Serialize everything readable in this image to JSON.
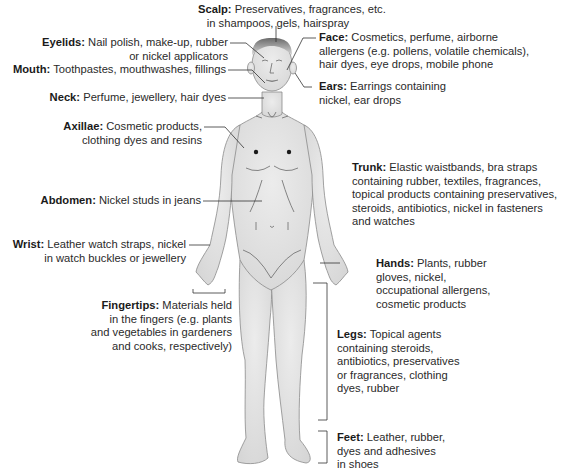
{
  "figure": {
    "body_fill": "#e4e4e4",
    "body_outline": "#8a8a8a",
    "line_color": "#333333"
  },
  "labels": {
    "scalp": {
      "title": "Scalp:",
      "lines": [
        "Preservatives, fragrances, etc.",
        "in shampoos, gels, hairspray"
      ]
    },
    "eyelids": {
      "title": "Eyelids:",
      "lines": [
        "Nail polish, make-up, rubber",
        "or nickel applicators"
      ]
    },
    "mouth": {
      "title": "Mouth:",
      "lines": [
        "Toothpastes, mouthwashes, fillings"
      ]
    },
    "neck": {
      "title": "Neck:",
      "lines": [
        "Perfume, jewellery, hair dyes"
      ]
    },
    "axillae": {
      "title": "Axillae:",
      "lines": [
        "Cosmetic products,",
        "clothing dyes and resins"
      ]
    },
    "abdomen": {
      "title": "Abdomen:",
      "lines": [
        "Nickel studs in jeans"
      ]
    },
    "wrist": {
      "title": "Wrist:",
      "lines": [
        "Leather watch straps, nickel",
        "in watch buckles or jewellery"
      ]
    },
    "fingertips": {
      "title": "Fingertips:",
      "lines": [
        "Materials held",
        "in the fingers (e.g. plants",
        "and vegetables in gardeners",
        "and cooks, respectively)"
      ]
    },
    "face": {
      "title": "Face:",
      "lines": [
        "Cosmetics, perfume, airborne",
        "allergens (e.g. pollens, volatile chemicals),",
        "hair dyes, eye drops, mobile phone"
      ]
    },
    "ears": {
      "title": "Ears:",
      "lines": [
        "Earrings containing",
        "nickel, ear drops"
      ]
    },
    "trunk": {
      "title": "Trunk:",
      "lines": [
        "Elastic waistbands, bra straps",
        "containing rubber, textiles, fragrances,",
        "topical products containing preservatives,",
        "steroids, antibiotics, nickel in  fasteners",
        "and watches"
      ]
    },
    "hands": {
      "title": "Hands:",
      "lines": [
        "Plants, rubber",
        "gloves, nickel,",
        "occupational allergens,",
        "cosmetic products"
      ]
    },
    "legs": {
      "title": "Legs:",
      "lines": [
        "Topical agents",
        "containing steroids,",
        "antibiotics, preservatives",
        "or fragrances, clothing",
        "dyes, rubber"
      ]
    },
    "feet": {
      "title": "Feet:",
      "lines": [
        "Leather, rubber,",
        "dyes and adhesives",
        "in shoes"
      ]
    }
  }
}
